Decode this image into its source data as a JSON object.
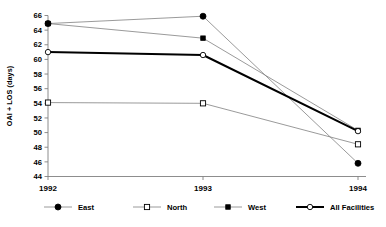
{
  "chart_data": {
    "type": "line",
    "title": "",
    "xlabel": "",
    "ylabel": "OAI + LOS (days)",
    "categories": [
      "1992",
      "1993",
      "1994"
    ],
    "x": [
      1992,
      1993,
      1994
    ],
    "xlim": [
      1992,
      1994
    ],
    "ylim": [
      44,
      66
    ],
    "yticks": [
      44,
      46,
      48,
      50,
      52,
      54,
      56,
      58,
      60,
      62,
      64,
      66
    ],
    "ytick_labels": [
      "44",
      "46",
      "48",
      "50",
      "52",
      "54",
      "56",
      "58",
      "60",
      "62",
      "64",
      "66"
    ],
    "grid": false,
    "legend_position": "bottom",
    "series": [
      {
        "name": "East",
        "values": [
          64.9,
          65.9,
          45.8
        ],
        "marker": "filled-circle",
        "line_color": "#808080",
        "marker_color": "#000000",
        "line_width": 0.8
      },
      {
        "name": "North",
        "values": [
          54.1,
          54.0,
          48.4
        ],
        "marker": "open-square",
        "line_color": "#808080",
        "marker_color": "#ffffff",
        "line_width": 0.8
      },
      {
        "name": "West",
        "values": [
          64.9,
          62.9,
          50.3
        ],
        "marker": "filled-square",
        "line_color": "#808080",
        "marker_color": "#000000",
        "line_width": 0.8
      },
      {
        "name": "All Facilities",
        "values": [
          61.0,
          60.6,
          50.2
        ],
        "marker": "open-circle",
        "line_color": "#000000",
        "marker_color": "#ffffff",
        "line_width": 2.0
      }
    ]
  },
  "axes": {
    "y_title": "OAI + LOS (days)",
    "ytick_labels": [
      "66",
      "64",
      "62",
      "60",
      "58",
      "56",
      "54",
      "52",
      "50",
      "48",
      "46",
      "44"
    ],
    "xtick_labels": [
      "1992",
      "1993",
      "1994"
    ]
  },
  "legend": {
    "items": [
      {
        "label": "East"
      },
      {
        "label": "North"
      },
      {
        "label": "West"
      },
      {
        "label": "All Facilities"
      }
    ]
  },
  "colors": {
    "axis": "#808080",
    "thin_line": "#8a8a8a",
    "thick_line": "#000000",
    "marker_fill": "#000000",
    "marker_open": "#ffffff",
    "text": "#000000",
    "background": "#ffffff"
  }
}
